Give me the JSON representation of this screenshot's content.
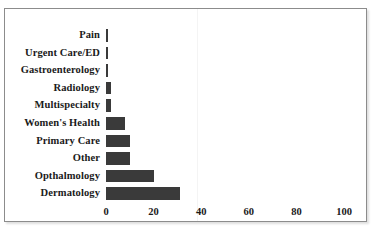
{
  "chart_data": {
    "type": "bar",
    "orientation": "horizontal",
    "title": "",
    "xlabel": "",
    "ylabel": "",
    "categories": [
      "Pain",
      "Urgent Care/ED",
      "Gastroenterology",
      "Radiology",
      "Multispecialty",
      "Women's Health",
      "Primary Care",
      "Other",
      "Opthalmology",
      "Dermatology"
    ],
    "values": [
      1,
      1,
      1,
      2,
      2,
      8,
      10,
      10,
      20,
      31
    ],
    "xlim": [
      0,
      100
    ],
    "xticks": [
      0,
      20,
      40,
      60,
      80,
      100
    ],
    "xtick_labels": [
      "0",
      "20",
      "40",
      "60",
      "80",
      "100"
    ],
    "grid": false,
    "legend": false,
    "bar_color": "#3a3a3a",
    "background_color": "#ffffff",
    "border_color": "#8c8c8c"
  }
}
